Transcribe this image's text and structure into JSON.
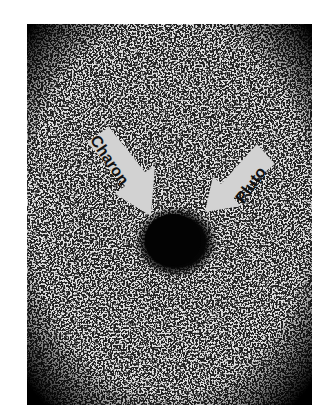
{
  "image": {
    "description": "Grainy black-and-white astronomical photograph showing a dark central blob with two annotation arrows",
    "colors": {
      "background": "#ffffff",
      "sky": "#dedede",
      "grain": "#222222",
      "blob": "#050505",
      "arrow_fill": "#d4d4d4",
      "label_text": "#111111"
    }
  },
  "annotations": {
    "charon": {
      "label": "Charon"
    },
    "pluto": {
      "label": "Pluto"
    }
  }
}
